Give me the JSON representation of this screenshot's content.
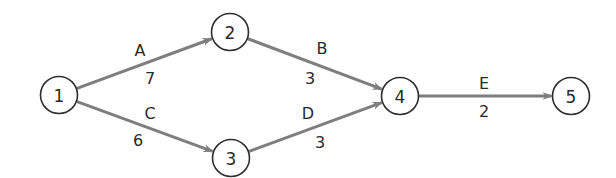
{
  "diagram": {
    "type": "activity-on-arrow network",
    "colors": {
      "edge": "#7e7e7e",
      "node_stroke": "#2e2e2e",
      "text": "#2a2a2a",
      "background": "#ffffff"
    },
    "nodes": [
      {
        "id": "1",
        "label": "1",
        "cx": 59,
        "cy": 95
      },
      {
        "id": "2",
        "label": "2",
        "cx": 230,
        "cy": 32
      },
      {
        "id": "3",
        "label": "3",
        "cx": 231,
        "cy": 158
      },
      {
        "id": "4",
        "label": "4",
        "cx": 400,
        "cy": 96
      },
      {
        "id": "5",
        "label": "5",
        "cx": 571,
        "cy": 96
      }
    ],
    "edges": [
      {
        "from": "1",
        "to": "2",
        "activity": "A",
        "duration": "7",
        "activity_pos": [
          140,
          50
        ],
        "duration_pos": [
          150,
          78
        ]
      },
      {
        "from": "1",
        "to": "3",
        "activity": "C",
        "duration": "6",
        "activity_pos": [
          150,
          113
        ],
        "duration_pos": [
          138,
          140
        ]
      },
      {
        "from": "2",
        "to": "4",
        "activity": "B",
        "duration": "3",
        "activity_pos": [
          322,
          48
        ],
        "duration_pos": [
          310,
          78
        ]
      },
      {
        "from": "3",
        "to": "4",
        "activity": "D",
        "duration": "3",
        "activity_pos": [
          308,
          113
        ],
        "duration_pos": [
          320,
          142
        ]
      },
      {
        "from": "4",
        "to": "5",
        "activity": "E",
        "duration": "2",
        "activity_pos": [
          484,
          83
        ],
        "duration_pos": [
          484,
          111
        ]
      }
    ]
  }
}
